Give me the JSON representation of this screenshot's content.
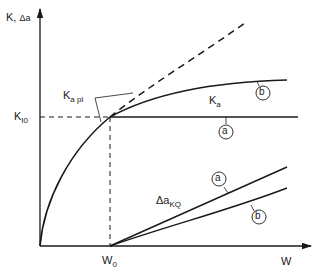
{
  "diagram": {
    "y_axis_label": {
      "main": "K, ",
      "delta": "Δa"
    },
    "x_axis_label": "W",
    "k_i0_label": {
      "main": "K",
      "sub": "I0"
    },
    "w0_label": {
      "main": "W",
      "sub": "0"
    },
    "k_a_pl_label": {
      "main": "K",
      "sub": "a pl"
    },
    "k_a_label": {
      "main": "K",
      "sub": "a"
    },
    "delta_a_kq_label": {
      "main": "Δa",
      "sub": "KQ"
    },
    "curve_markers": {
      "upper_b": "b",
      "horizontal_a": "a",
      "delta_a": "a",
      "delta_b": "b"
    },
    "colors": {
      "ink": "#1a1a1a",
      "background": "#ffffff"
    }
  }
}
